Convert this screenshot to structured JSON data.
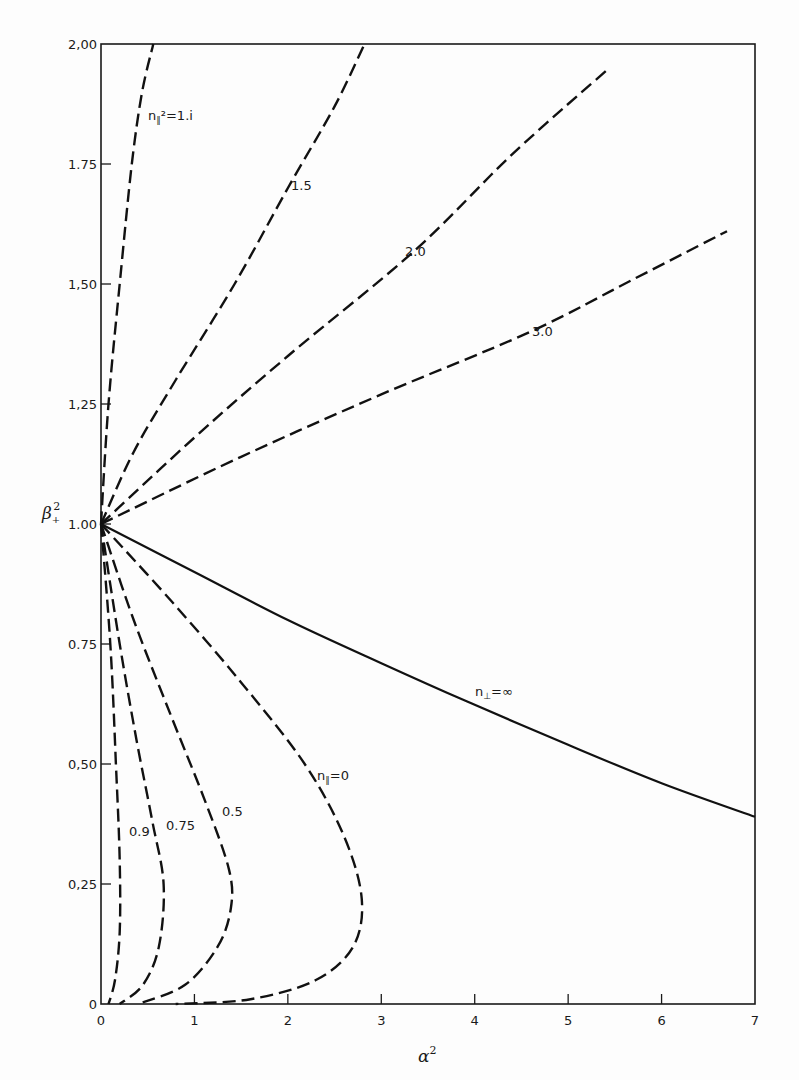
{
  "chart_data": {
    "type": "line",
    "title": "",
    "xlabel": "α²",
    "ylabel": "β₊²",
    "xlim": [
      0,
      7
    ],
    "ylim": [
      0,
      2.0
    ],
    "grid": false,
    "legend": "inline curve labels",
    "x_ticks": [
      "0",
      "1",
      "2",
      "3",
      "4",
      "5",
      "6",
      "7"
    ],
    "y_ticks": [
      "0",
      "0.25",
      "0.50",
      "0.75",
      "1.00",
      "1.25",
      "1.50",
      "1.75",
      "2.00"
    ],
    "y_tick_labels_display": [
      "0",
      "0,25",
      "0,50",
      "0.75",
      "1.00",
      "1,25",
      "1,50",
      "1.75",
      "2,00"
    ],
    "series": [
      {
        "name": "n∥² = 1.1",
        "label": "n∥²=1.i",
        "style": "dashed",
        "x": [
          0,
          0.08,
          0.2,
          0.33,
          0.44,
          0.56
        ],
        "y": [
          1.0,
          1.25,
          1.5,
          1.75,
          1.9,
          2.0
        ]
      },
      {
        "name": "n∥² = 1.5",
        "label": "1.5",
        "style": "dashed",
        "x": [
          0,
          0.35,
          0.8,
          1.43,
          2.0,
          2.5,
          2.82
        ],
        "y": [
          1.0,
          1.15,
          1.3,
          1.5,
          1.7,
          1.87,
          2.0
        ]
      },
      {
        "name": "n∥² = 2.0",
        "label": "2.0",
        "style": "dashed",
        "x": [
          0,
          1.0,
          2.0,
          3.36,
          4.4,
          5.44
        ],
        "y": [
          1.0,
          1.18,
          1.35,
          1.57,
          1.77,
          1.95
        ]
      },
      {
        "name": "n∥² = 3.0",
        "label": "3.0",
        "style": "dashed",
        "x": [
          0,
          1.5,
          3.0,
          4.59,
          5.7,
          6.7
        ],
        "y": [
          1.0,
          1.14,
          1.27,
          1.4,
          1.51,
          1.61
        ]
      },
      {
        "name": "n⊥ = ∞",
        "label": "n⊥=∞",
        "style": "solid",
        "x": [
          0,
          1.0,
          2.0,
          3.0,
          3.92,
          5.0,
          6.0,
          7.0
        ],
        "y": [
          1.0,
          0.9,
          0.8,
          0.71,
          0.63,
          0.54,
          0.46,
          0.39
        ]
      },
      {
        "name": "n∥² = 0.9",
        "label": "0.9",
        "style": "dashed",
        "x": [
          0,
          0.1,
          0.16,
          0.2,
          0.2,
          0.15,
          0.08
        ],
        "y": [
          1.0,
          0.75,
          0.5,
          0.3,
          0.15,
          0.05,
          0.0
        ]
      },
      {
        "name": "n∥² = 0.75",
        "label": "0.75",
        "style": "dashed",
        "x": [
          0,
          0.2,
          0.38,
          0.55,
          0.67,
          0.62,
          0.45,
          0.2
        ],
        "y": [
          1.0,
          0.75,
          0.55,
          0.38,
          0.25,
          0.12,
          0.04,
          0.0
        ]
      },
      {
        "name": "n∥² = 0.5",
        "label": "0.5",
        "style": "dashed",
        "x": [
          0,
          0.35,
          0.75,
          1.12,
          1.37,
          1.39,
          1.25,
          0.9,
          0.4
        ],
        "y": [
          1.0,
          0.8,
          0.6,
          0.42,
          0.28,
          0.2,
          0.12,
          0.04,
          0.0
        ]
      },
      {
        "name": "n∥ = 0",
        "label": "n∥=0",
        "style": "dashed",
        "x": [
          0,
          0.75,
          1.5,
          2.18,
          2.6,
          2.79,
          2.7,
          2.3,
          1.6,
          0.8
        ],
        "y": [
          1.0,
          0.84,
          0.67,
          0.5,
          0.35,
          0.22,
          0.12,
          0.05,
          0.01,
          0.0
        ]
      }
    ],
    "annotations": [
      "n∥²=1.i",
      "1.5",
      "2.0",
      "3.0",
      "n⊥=∞",
      "n∥=0",
      "0.5",
      "0.75",
      "0.9"
    ]
  },
  "labels": {
    "x_axis": "α",
    "x_axis_sup": "2",
    "y_axis": "β",
    "y_axis_sub": "+",
    "y_axis_sup": "2",
    "curve_1_1": "n",
    "curve_1_1_sub": "∥",
    "curve_1_1_rest": "²=1.i",
    "curve_1_5": "1.5",
    "curve_2_0": "2.0",
    "curve_3_0": "3.0",
    "curve_inf": "n",
    "curve_inf_sub": "⊥",
    "curve_inf_rest": "=∞",
    "curve_0": "n",
    "curve_0_sub": "∥",
    "curve_0_rest": "=0",
    "curve_0_5": "0.5",
    "curve_0_75": "0.75",
    "curve_0_9": "0.9"
  }
}
